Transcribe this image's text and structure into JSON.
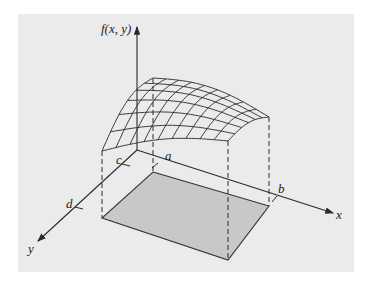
{
  "figure": {
    "labels": {
      "z_axis": "f(x, y)",
      "x_axis": "x",
      "y_axis": "y",
      "a": "a",
      "b": "b",
      "c": "c",
      "d": "d"
    },
    "colors": {
      "background": "#ebebeb",
      "region_fill": "#c8c8c8",
      "line": "#2a2a2a"
    },
    "surface_grid": {
      "rows": 6,
      "cols": 9
    }
  }
}
